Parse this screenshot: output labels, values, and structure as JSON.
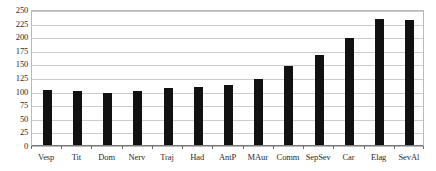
{
  "chart_data": {
    "type": "bar",
    "title": "",
    "subtitle": "",
    "xlabel": "",
    "ylabel": "",
    "categories": [
      "Vesp",
      "Tit",
      "Dom",
      "Nerv",
      "Traj",
      "Had",
      "AntP",
      "MAur",
      "Comm",
      "SepSev",
      "Car",
      "Elag",
      "SevAl"
    ],
    "values": [
      102,
      99,
      95,
      99,
      104,
      107,
      110,
      122,
      146,
      166,
      196,
      231,
      230
    ],
    "series": [
      {
        "name": "",
        "values": [
          102,
          99,
          95,
          99,
          104,
          107,
          110,
          122,
          146,
          166,
          196,
          231,
          230
        ]
      }
    ],
    "ylim": [
      0,
      250
    ],
    "yticks": [
      0,
      25,
      50,
      75,
      100,
      125,
      150,
      175,
      200,
      225,
      250
    ],
    "ytick_labels": [
      "0",
      "25",
      "50",
      "75",
      "100",
      "125",
      "150",
      "175",
      "200",
      "225",
      "250"
    ],
    "grid": true,
    "grid_axis": "y",
    "legend": false,
    "legend_position": "none",
    "bar_color": "#111111",
    "grid_color": "#cccccc",
    "frame_color": "#b9b9b9",
    "background_color": "#ffffff",
    "text_color": "#2b2b2b"
  }
}
